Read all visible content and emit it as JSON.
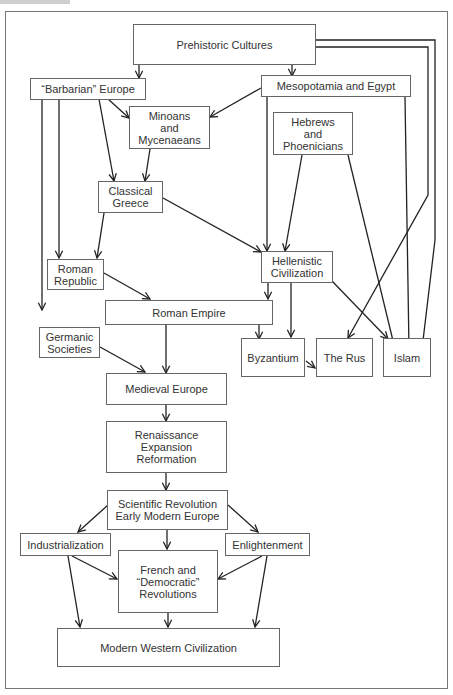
{
  "diagram": {
    "nodes": {
      "prehistoric": "Prehistoric Cultures",
      "barbarian": "“Barbarian” Europe",
      "mesopotamia": "Mesopotamia and Egypt",
      "minoans": "Minoans\nand\nMycenaeans",
      "hebrews": "Hebrews\nand\nPhoenicians",
      "classical_greece": "Classical\nGreece",
      "roman_republic": "Roman\nRepublic",
      "hellenistic": "Hellenistic\nCivilization",
      "roman_empire": "Roman Empire",
      "germanic": "Germanic\nSocieties",
      "byzantium": "Byzantium",
      "the_rus": "The Rus",
      "islam": "Islam",
      "medieval": "Medieval Europe",
      "renaissance": "Renaissance\nExpansion\nReformation",
      "scientific": "Scientific Revolution\nEarly Modern Europe",
      "industrialization": "Industrialization",
      "enlightenment": "Enlightenment",
      "french": "French and\n“Democratic”\nRevolutions",
      "modern": "Modern Western Civilization"
    },
    "edges": [
      [
        "Prehistoric Cultures",
        "“Barbarian” Europe"
      ],
      [
        "Prehistoric Cultures",
        "Mesopotamia and Egypt"
      ],
      [
        "Prehistoric Cultures",
        "The Rus"
      ],
      [
        "Prehistoric Cultures",
        "Islam"
      ],
      [
        "“Barbarian” Europe",
        "Minoans and Mycenaeans"
      ],
      [
        "“Barbarian” Europe",
        "Classical Greece"
      ],
      [
        "“Barbarian” Europe",
        "Roman Republic"
      ],
      [
        "“Barbarian” Europe",
        "Germanic Societies"
      ],
      [
        "Mesopotamia and Egypt",
        "Minoans and Mycenaeans"
      ],
      [
        "Mesopotamia and Egypt",
        "Hellenistic Civilization"
      ],
      [
        "Mesopotamia and Egypt",
        "Islam"
      ],
      [
        "Minoans and Mycenaeans",
        "Classical Greece"
      ],
      [
        "Hebrews and Phoenicians",
        "Hellenistic Civilization"
      ],
      [
        "Hebrews and Phoenicians",
        "Islam"
      ],
      [
        "Classical Greece",
        "Roman Republic"
      ],
      [
        "Classical Greece",
        "Hellenistic Civilization"
      ],
      [
        "Roman Republic",
        "Roman Empire"
      ],
      [
        "Hellenistic Civilization",
        "Roman Empire"
      ],
      [
        "Hellenistic Civilization",
        "Byzantium"
      ],
      [
        "Hellenistic Civilization",
        "Islam"
      ],
      [
        "Roman Empire",
        "Byzantium"
      ],
      [
        "Roman Empire",
        "Medieval Europe"
      ],
      [
        "Germanic Societies",
        "Medieval Europe"
      ],
      [
        "Byzantium",
        "The Rus"
      ],
      [
        "Medieval Europe",
        "Renaissance Expansion Reformation"
      ],
      [
        "Renaissance Expansion Reformation",
        "Scientific Revolution Early Modern Europe"
      ],
      [
        "Scientific Revolution Early Modern Europe",
        "Industrialization"
      ],
      [
        "Scientific Revolution Early Modern Europe",
        "Enlightenment"
      ],
      [
        "Scientific Revolution Early Modern Europe",
        "French and Democratic Revolutions"
      ],
      [
        "Industrialization",
        "French and Democratic Revolutions"
      ],
      [
        "Industrialization",
        "Modern Western Civilization"
      ],
      [
        "Enlightenment",
        "French and Democratic Revolutions"
      ],
      [
        "Enlightenment",
        "Modern Western Civilization"
      ],
      [
        "French and Democratic Revolutions",
        "Modern Western Civilization"
      ]
    ]
  }
}
